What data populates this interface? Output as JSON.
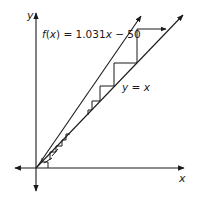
{
  "diagram": {
    "type": "cobweb",
    "axes": {
      "x_label": "x",
      "y_label": "y"
    },
    "curves": [
      {
        "name": "f",
        "label": "f(x) = 1.031x − 50",
        "slope": 1.031,
        "intercept": -50
      },
      {
        "name": "identity",
        "label": "y = x",
        "slope": 1,
        "intercept": 0
      }
    ],
    "cobweb_note": "Iterations diverge away from the fixed point",
    "colors": {
      "line": "#1a1a1a",
      "background": "#ffffff"
    }
  },
  "labels": {
    "y_axis": "y",
    "x_axis": "x",
    "f_prefix": "f",
    "f_paren_open": "(",
    "f_var": "x",
    "f_rest": ") = 1.031",
    "f_var2": "x",
    "f_tail": " − 50",
    "id_y": "y",
    "id_eq": " = ",
    "id_x": "x"
  }
}
